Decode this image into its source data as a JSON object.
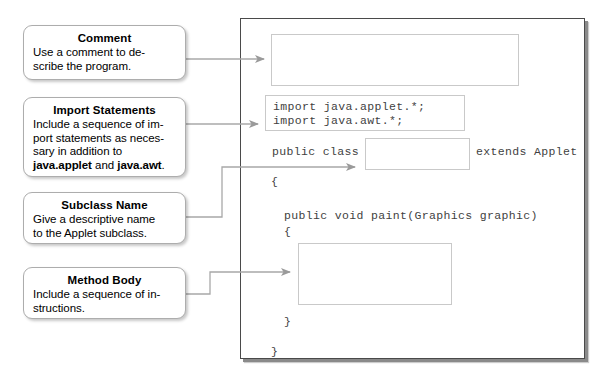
{
  "callouts": [
    {
      "id": "comment",
      "title": "Comment",
      "body_lines": [
        "Use a comment to de-",
        "scribe the program."
      ]
    },
    {
      "id": "import-statements",
      "title": "Import Statements",
      "body_lines": [
        "Include a sequence of im-",
        "port statements as neces-",
        "sary in addition to"
      ],
      "body_last_prefix": "",
      "bold_1": "java.applet",
      "mid_text": " and ",
      "bold_2": "java.awt",
      "body_last_suffix": "."
    },
    {
      "id": "subclass-name",
      "title": "Subclass Name",
      "body_lines": [
        "Give a descriptive name",
        "to the Applet subclass."
      ]
    },
    {
      "id": "method-body",
      "title": "Method Body",
      "body_lines": [
        "Include a sequence of in-",
        "structions."
      ]
    }
  ],
  "code": {
    "comment_placeholder": "",
    "import_line_1": "import java.applet.*;",
    "import_line_2": "import java.awt.*;",
    "class_decl_prefix": "public class",
    "class_name_placeholder": "",
    "class_decl_suffix": "extends Applet",
    "class_open_brace": "{",
    "paint_signature": "public void paint(Graphics graphic)",
    "paint_open_brace": "{",
    "method_body_placeholder": "",
    "paint_close_brace": "}",
    "class_close_brace": "}"
  },
  "colors": {
    "panel_border": "#4a4a4a",
    "panel_shadow": "#8a8a8a",
    "callout_border": "#adadad",
    "code_text": "#3f3f3f",
    "fill_box_border": "#c9c9c9",
    "connector": "#a8a8a8",
    "arrowhead": "#9a9a9a"
  }
}
